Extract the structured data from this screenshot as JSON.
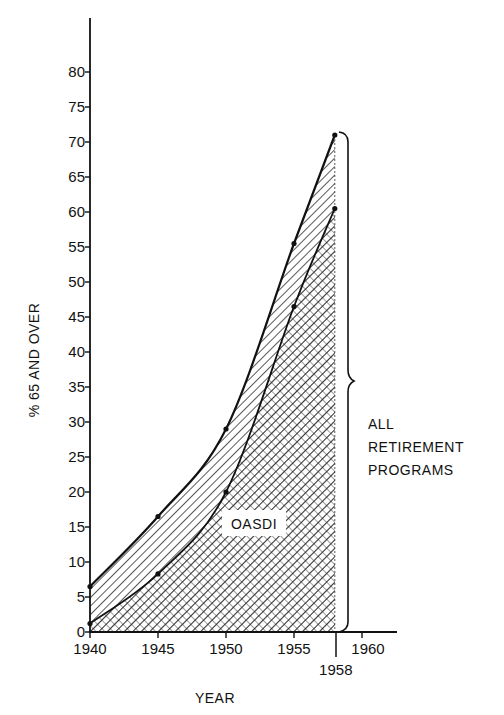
{
  "chart_data": {
    "type": "area",
    "title": "",
    "xlabel": "YEAR",
    "ylabel": "% 65 AND OVER",
    "x": [
      1940,
      1945,
      1950,
      1955,
      1958
    ],
    "series": [
      {
        "name": "ALL RETIREMENT PROGRAMS",
        "values": [
          6.5,
          16.5,
          29,
          55.5,
          71
        ],
        "fill": "diagonal-hatch"
      },
      {
        "name": "OASDI",
        "values": [
          1.2,
          8.3,
          20,
          46.5,
          60.5
        ],
        "fill": "cross-hatch"
      }
    ],
    "x_ticks": [
      "1940",
      "1945",
      "1950",
      "1955",
      "1958",
      "1960"
    ],
    "y_ticks": [
      "0",
      "5",
      "10",
      "15",
      "20",
      "25",
      "30",
      "35",
      "40",
      "45",
      "50",
      "55",
      "60",
      "65",
      "70",
      "75",
      "80"
    ],
    "xlim": [
      1940,
      1962
    ],
    "ylim": [
      0,
      85
    ],
    "grid": false,
    "legend": "none",
    "annotations": [
      {
        "text": "OASDI",
        "at": "inside cross-hatched area"
      },
      {
        "text": "ALL RETIREMENT PROGRAMS",
        "at": "right brace spanning 0-71 at 1958"
      }
    ]
  },
  "labels": {
    "xlabel": "YEAR",
    "ylabel": "% 65 AND OVER",
    "oasdi": "OASDI",
    "bracket_line1": "ALL",
    "bracket_line2": "RETIREMENT",
    "bracket_line3": "PROGRAMS"
  },
  "colors": {
    "ink": "#111111",
    "background": "#ffffff"
  }
}
